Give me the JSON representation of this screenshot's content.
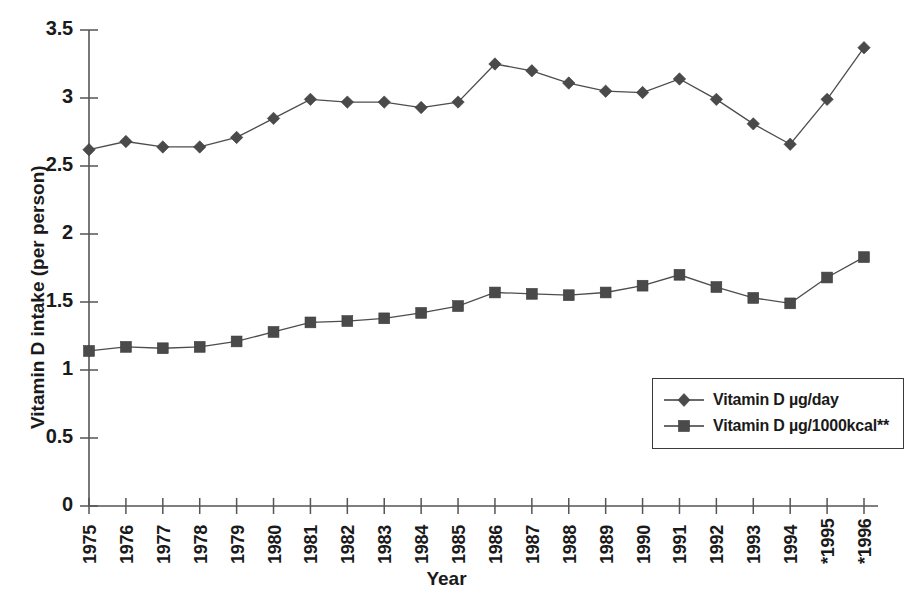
{
  "chart_data": {
    "type": "line",
    "title": "",
    "xlabel": "Year",
    "ylabel": "Vitamin D intake (per person)",
    "ylim": [
      0,
      3.5
    ],
    "ytick_labels": [
      "0",
      "0.5",
      "1",
      "1.5",
      "2",
      "2.5",
      "3",
      "3.5"
    ],
    "ytick_values": [
      0,
      0.5,
      1,
      1.5,
      2,
      2.5,
      3,
      3.5
    ],
    "grid": false,
    "legend_position": "inside-lower-right",
    "categories": [
      "1975",
      "1976",
      "1977",
      "1978",
      "1979",
      "1980",
      "1981",
      "1982",
      "1983",
      "1984",
      "1985",
      "1986",
      "1987",
      "1988",
      "1989",
      "1990",
      "1991",
      "1992",
      "1993",
      "1994",
      "*1995",
      "*1996"
    ],
    "series": [
      {
        "name": "Vitamin D µg/day",
        "marker": "diamond",
        "color": "#4a4a4a",
        "values": [
          2.62,
          2.68,
          2.64,
          2.64,
          2.71,
          2.85,
          2.99,
          2.97,
          2.97,
          2.93,
          2.97,
          3.25,
          3.2,
          3.11,
          3.05,
          3.04,
          3.14,
          2.99,
          2.81,
          2.66,
          2.99,
          3.37
        ]
      },
      {
        "name": "Vitamin D µg/1000kcal**",
        "marker": "square",
        "color": "#4a4a4a",
        "values": [
          1.14,
          1.17,
          1.16,
          1.17,
          1.21,
          1.28,
          1.35,
          1.36,
          1.38,
          1.42,
          1.47,
          1.57,
          1.56,
          1.55,
          1.57,
          1.62,
          1.7,
          1.61,
          1.53,
          1.49,
          1.68,
          1.83
        ]
      }
    ]
  },
  "legend": {
    "items": [
      {
        "label": "Vitamin D µg/day",
        "marker": "diamond"
      },
      {
        "label": "Vitamin D µg/1000kcal**",
        "marker": "square"
      }
    ]
  }
}
